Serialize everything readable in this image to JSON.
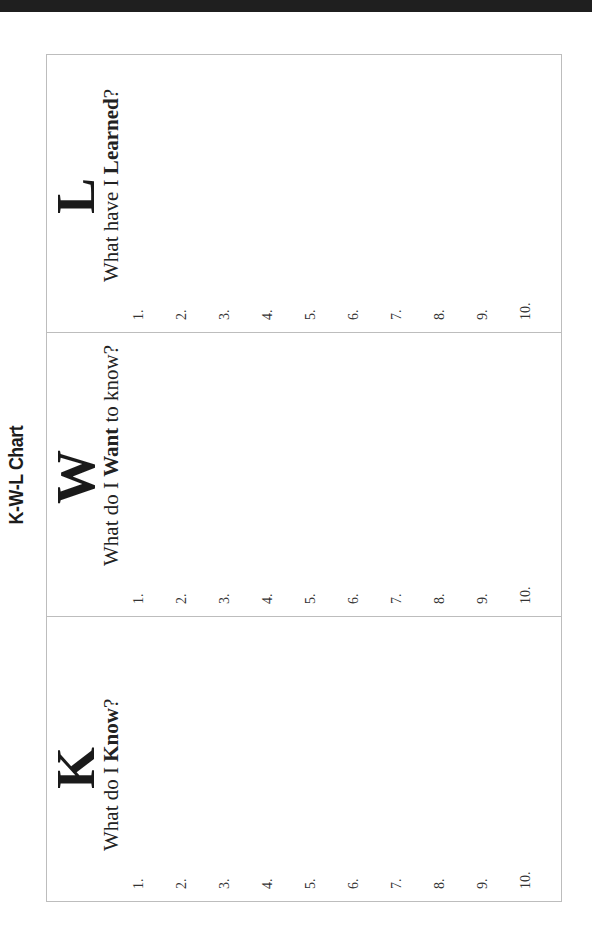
{
  "page": {
    "title": "K-W-L Chart",
    "orientation": "landscape-rotated-90-ccw"
  },
  "columns": [
    {
      "letter": "K",
      "question_before": "What do I ",
      "question_bold": "Know",
      "question_after": "?",
      "lines": [
        "1.",
        "2.",
        "3.",
        "4.",
        "5.",
        "6.",
        "7.",
        "8.",
        "9.",
        "10."
      ]
    },
    {
      "letter": "W",
      "question_before": "What do I ",
      "question_bold": "Want",
      "question_after": " to know?",
      "lines": [
        "1.",
        "2.",
        "3.",
        "4.",
        "5.",
        "6.",
        "7.",
        "8.",
        "9.",
        "10."
      ]
    },
    {
      "letter": "L",
      "question_before": "What have I ",
      "question_bold": "Learned",
      "question_after": "?",
      "lines": [
        "1.",
        "2.",
        "3.",
        "4.",
        "5.",
        "6.",
        "7.",
        "8.",
        "9.",
        "10."
      ]
    }
  ],
  "colors": {
    "top_bar": "#1f1f1f",
    "border": "#bdbdbd",
    "text": "#1a1a1a"
  }
}
